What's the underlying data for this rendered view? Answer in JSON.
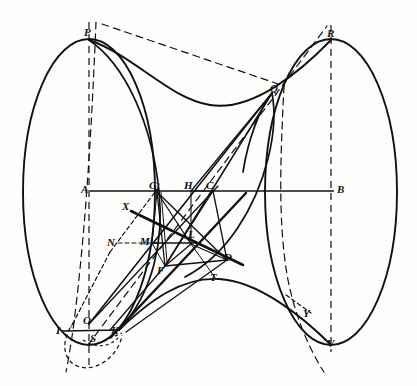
{
  "figure": {
    "domain": "diagram",
    "canvas": {
      "width": 417,
      "height": 386
    },
    "ink_color": "#111111",
    "background_color": "#fdfdfb"
  },
  "labels": [
    {
      "id": "P",
      "text": "P",
      "x": 84,
      "y": 27
    },
    {
      "id": "R",
      "text": "R",
      "x": 327,
      "y": 28
    },
    {
      "id": "Q",
      "text": "Q",
      "x": 270,
      "y": 83
    },
    {
      "id": "A",
      "text": "A",
      "x": 81,
      "y": 184
    },
    {
      "id": "B",
      "text": "B",
      "x": 337,
      "y": 184
    },
    {
      "id": "G",
      "text": "G",
      "x": 149,
      "y": 180
    },
    {
      "id": "H",
      "text": "H",
      "x": 184,
      "y": 180
    },
    {
      "id": "C",
      "text": "C",
      "x": 206,
      "y": 180
    },
    {
      "id": "X",
      "text": "X",
      "x": 122,
      "y": 201
    },
    {
      "id": "N",
      "text": "N",
      "x": 107,
      "y": 237
    },
    {
      "id": "M",
      "text": "M",
      "x": 140,
      "y": 236
    },
    {
      "id": "L",
      "text": "L",
      "x": 188,
      "y": 229
    },
    {
      "id": "D",
      "text": "D",
      "x": 224,
      "y": 252
    },
    {
      "id": "F",
      "text": "F",
      "x": 157,
      "y": 265
    },
    {
      "id": "T",
      "text": "T",
      "x": 210,
      "y": 272
    },
    {
      "id": "Y",
      "text": "Y",
      "x": 303,
      "y": 308
    },
    {
      "id": "I",
      "text": "I",
      "x": 56,
      "y": 325
    },
    {
      "id": "O",
      "text": "O",
      "x": 83,
      "y": 318
    },
    {
      "id": "K",
      "text": "K",
      "x": 111,
      "y": 325
    },
    {
      "id": "S",
      "text": "S",
      "x": 90,
      "y": 333
    },
    {
      "id": "V",
      "text": "V",
      "x": 327,
      "y": 338
    }
  ],
  "points": {
    "P": {
      "x": 89,
      "y": 40
    },
    "R": {
      "x": 331,
      "y": 40
    },
    "Q": {
      "x": 272,
      "y": 93
    },
    "A": {
      "x": 90,
      "y": 191
    },
    "B": {
      "x": 334,
      "y": 191
    },
    "G": {
      "x": 157,
      "y": 192
    },
    "H": {
      "x": 191,
      "y": 191
    },
    "C": {
      "x": 213,
      "y": 191
    },
    "X": {
      "x": 131,
      "y": 211
    },
    "N": {
      "x": 118,
      "y": 243
    },
    "M": {
      "x": 152,
      "y": 243
    },
    "L": {
      "x": 191,
      "y": 244
    },
    "D": {
      "x": 227,
      "y": 260
    },
    "F": {
      "x": 165,
      "y": 266
    },
    "T": {
      "x": 216,
      "y": 279
    },
    "Y": {
      "x": 311,
      "y": 312
    },
    "I": {
      "x": 63,
      "y": 331
    },
    "O": {
      "x": 89,
      "y": 324
    },
    "K": {
      "x": 119,
      "y": 330
    },
    "S": {
      "x": 95,
      "y": 340
    },
    "V": {
      "x": 331,
      "y": 345
    }
  },
  "elements": {
    "left_ellipse": "left end disc of the hyperboloid, major axis vertical",
    "right_ellipse": "right end disc of the hyperboloid, major axis vertical",
    "top_waist": "upper hyperbolic outline from P to R",
    "bottom_waist": "lower hyperbolic outline from I-K to V",
    "axis_AB": "horizontal central axis from A to B",
    "axis_PO": "vertical dashed chord through P",
    "axis_RV": "vertical dashed chord through R to V",
    "generator_lines": "straight line generators of the ruled surface",
    "dashed_construction": "dashed auxiliary construction curves and chords"
  },
  "stroke_widths": {
    "outline": 1.9,
    "generator": 1.5,
    "thick_generator": 2.4,
    "thin": 1.0,
    "dashed": 1.1
  },
  "dash_patterns": {
    "long": "7 4",
    "short": "4 3",
    "fine": "3 3"
  }
}
